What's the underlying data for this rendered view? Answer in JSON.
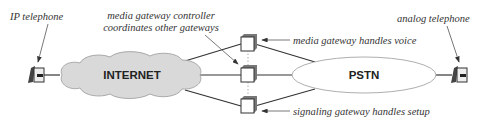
{
  "diagram": {
    "nodes": {
      "ip_phone": {
        "label": "IP telephone"
      },
      "internet": {
        "label": "INTERNET"
      },
      "pstn": {
        "label": "PSTN"
      },
      "analog_phone": {
        "label": "analog telephone"
      },
      "mgc": {
        "label_line1": "media gateway controller",
        "label_line2": "coordinates other gateways"
      },
      "media_gateway": {
        "label": "media gateway handles voice"
      },
      "signaling_gateway": {
        "label": "signaling gateway handles setup"
      }
    },
    "colors": {
      "cloud_fill": "#d9d9d9",
      "line": "#333333",
      "gateway_side": "#777777",
      "ellipse_fill": "#ffffff"
    }
  }
}
